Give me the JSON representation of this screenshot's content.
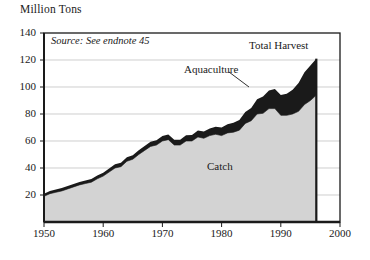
{
  "chart_data": {
    "type": "area",
    "title": "",
    "ylabel": "Million Tons",
    "xlabel": "",
    "ylim": [
      0,
      140
    ],
    "xlim": [
      1950,
      2000
    ],
    "grid": true,
    "legend_position": "inline-annotations",
    "yticks": [
      "140",
      "120",
      "100",
      "80",
      "60",
      "40",
      "20"
    ],
    "ytick_values": [
      140,
      120,
      100,
      80,
      60,
      40,
      20
    ],
    "xticks": [
      "1950",
      "1960",
      "1970",
      "1980",
      "1990",
      "2000"
    ],
    "xtick_values": [
      1950,
      1960,
      1970,
      1980,
      1990,
      2000
    ],
    "annotations": {
      "source": "Source: See endnote 45",
      "total_harvest": "Total Harvest",
      "aquaculture": "Aquaculture",
      "catch": "Catch"
    },
    "x": [
      1950,
      1951,
      1952,
      1953,
      1954,
      1955,
      1956,
      1957,
      1958,
      1959,
      1960,
      1961,
      1962,
      1963,
      1964,
      1965,
      1966,
      1967,
      1968,
      1969,
      1970,
      1971,
      1972,
      1973,
      1974,
      1975,
      1976,
      1977,
      1978,
      1979,
      1980,
      1981,
      1982,
      1983,
      1984,
      1985,
      1986,
      1987,
      1988,
      1989,
      1990,
      1991,
      1992,
      1993,
      1994,
      1995,
      1996
    ],
    "series": [
      {
        "name": "Catch",
        "color": "#d3d3d3",
        "values": [
          19.0,
          21.0,
          22.0,
          23.0,
          24.5,
          26.0,
          27.5,
          28.5,
          29.5,
          32.0,
          34.0,
          37.0,
          40.0,
          41.0,
          45.0,
          46.5,
          50.0,
          53.0,
          56.0,
          57.0,
          60.0,
          61.0,
          57.0,
          57.0,
          60.0,
          60.0,
          63.0,
          62.0,
          64.0,
          65.0,
          64.0,
          66.0,
          66.5,
          68.0,
          73.0,
          75.0,
          80.0,
          80.5,
          84.0,
          84.0,
          79.0,
          79.0,
          80.0,
          82.0,
          87.0,
          90.0,
          94.0
        ]
      },
      {
        "name": "Aquaculture",
        "color": "#3a3a3a",
        "values": [
          2.0,
          2.0,
          2.0,
          2.1,
          2.1,
          2.2,
          2.2,
          2.3,
          2.3,
          2.4,
          2.5,
          2.6,
          2.7,
          2.8,
          2.9,
          3.0,
          3.2,
          3.3,
          3.5,
          3.6,
          3.7,
          3.8,
          3.9,
          4.0,
          4.2,
          4.5,
          4.8,
          5.0,
          5.3,
          5.6,
          6.0,
          6.5,
          7.0,
          7.5,
          8.5,
          9.5,
          11.0,
          12.5,
          13.5,
          14.5,
          15.0,
          16.0,
          18.0,
          21.0,
          24.0,
          26.0,
          27.0
        ]
      },
      {
        "name": "Total Harvest",
        "color": "#1a1a1a",
        "values": [
          21.0,
          23.0,
          24.0,
          25.1,
          26.6,
          28.2,
          29.7,
          30.8,
          31.8,
          34.4,
          36.5,
          39.6,
          42.7,
          43.8,
          47.9,
          49.5,
          53.2,
          56.3,
          59.5,
          60.6,
          63.7,
          64.8,
          60.9,
          61.0,
          64.2,
          64.5,
          67.8,
          67.0,
          69.3,
          70.6,
          70.0,
          72.5,
          73.5,
          75.5,
          81.5,
          84.5,
          91.0,
          93.0,
          97.5,
          98.5,
          94.0,
          95.0,
          98.0,
          103.0,
          111.0,
          116.0,
          121.0
        ]
      }
    ]
  }
}
